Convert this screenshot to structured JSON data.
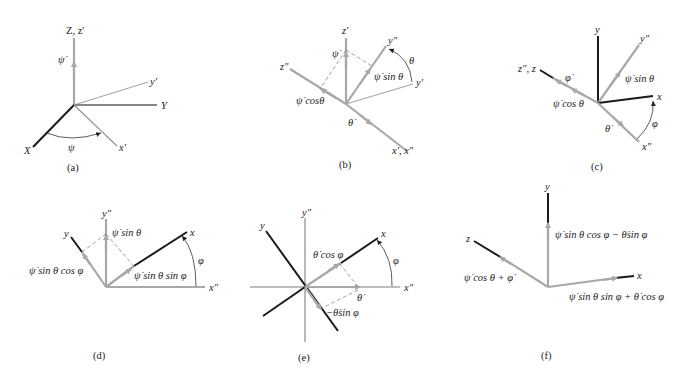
{
  "figure": {
    "panels": [
      {
        "id": "a",
        "caption": "(a)",
        "labels": {
          "z_axis": "Z, z'",
          "psi_dot": "ψ̇",
          "y_prime": "y'",
          "Y_axis": "Y",
          "X_axis": "X",
          "x_prime": "x'",
          "psi_angle": "ψ"
        }
      },
      {
        "id": "b",
        "caption": "(b)",
        "labels": {
          "z_prime": "z'",
          "psi_dot": "ψ̇",
          "y_double": "y\"",
          "theta_angle": "θ",
          "psi_sin_theta": "ψ̇ sin θ",
          "y_prime": "y'",
          "z_double": "z\"",
          "psi_cos_theta": "ψ̇  cosθ",
          "theta_dot": "θ̇",
          "x_prime_x_double": "x', x\""
        }
      },
      {
        "id": "c",
        "caption": "(c)",
        "labels": {
          "y_axis": "y",
          "y_double": "y\"",
          "z_double_z": "z\", z",
          "phi_dot": "φ̇",
          "psi_sin_theta": "ψ̇ sin θ",
          "psi_cos_theta": "ψ̇ cos θ",
          "x_axis": "x",
          "theta_dot": "θ̇",
          "phi_angle": "φ",
          "x_double": "x\""
        }
      },
      {
        "id": "d",
        "caption": "(d)",
        "labels": {
          "y_double": "y\"",
          "psi_sin_theta": "ψ̇ sin θ",
          "y_axis": "y",
          "x_axis": "x",
          "phi_angle": "φ",
          "psi_sin_theta_cos_phi": "ψ̇ sin θ cos φ",
          "psi_sin_theta_sin_phi": "ψ̇ sin θ sin φ",
          "x_double": "x\""
        }
      },
      {
        "id": "e",
        "caption": "(e)",
        "labels": {
          "y_double": "y\"",
          "y_axis": "y",
          "x_axis": "x",
          "theta_cos_phi": "θ̇ cos φ",
          "phi_angle": "φ",
          "x_double": "x\"",
          "theta_dot": "θ̇",
          "neg_theta_sin_phi": "−θ̇sin φ"
        }
      },
      {
        "id": "f",
        "caption": "(f)",
        "labels": {
          "y_axis": "y",
          "y_component": "ψ̇ sin θ cos φ − θ̇sin  φ",
          "z_axis": "z",
          "z_component": "ψ̇ cos θ + φ̇",
          "x_axis": "x",
          "x_component": "ψ̇  sin θ sin φ + θ̇ cos φ"
        }
      }
    ]
  }
}
